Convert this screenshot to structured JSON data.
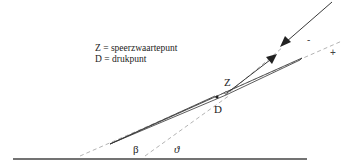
{
  "legend": {
    "z_line": "Z = speerzwaartepunt",
    "d_line": "D = drukpunt"
  },
  "labels": {
    "z": "Z",
    "d": "D",
    "beta": "β",
    "theta": "ϑ",
    "minus": "-",
    "plus": "+"
  },
  "colors": {
    "line": "#222222",
    "dashed": "#aaaaaa",
    "ground": "#444444"
  }
}
